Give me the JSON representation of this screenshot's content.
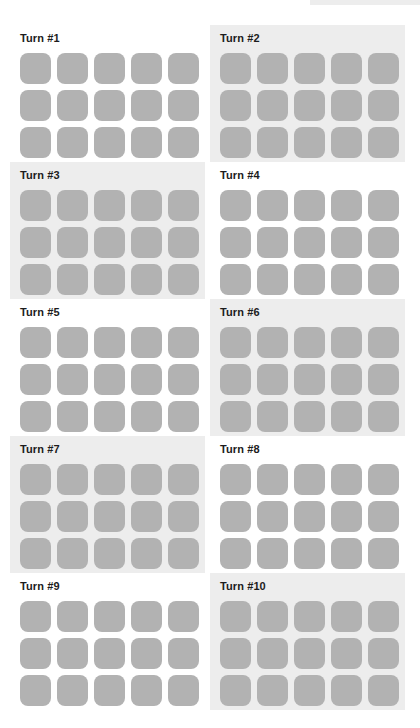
{
  "canvas": {
    "width": 420,
    "height": 728,
    "background_color": "#ffffff"
  },
  "palette": {
    "tile_color": "#b2b2b2",
    "panel_shaded_background": "#ededed",
    "panel_plain_background": "#ffffff",
    "label_color": "#1c1c1c"
  },
  "board": {
    "columns": 2,
    "rows": 5,
    "grid_columns_per_panel": 5,
    "grid_rows_per_panel": 3,
    "tiles_per_panel": 15,
    "panels": [
      {
        "label": "Turn #1",
        "turn_number": 1,
        "shaded": false,
        "tiles": [
          [
            "#b2b2b2",
            "#b2b2b2",
            "#b2b2b2",
            "#b2b2b2",
            "#b2b2b2"
          ],
          [
            "#b2b2b2",
            "#b2b2b2",
            "#b2b2b2",
            "#b2b2b2",
            "#b2b2b2"
          ],
          [
            "#b2b2b2",
            "#b2b2b2",
            "#b2b2b2",
            "#b2b2b2",
            "#b2b2b2"
          ]
        ]
      },
      {
        "label": "Turn #2",
        "turn_number": 2,
        "shaded": true,
        "tiles": [
          [
            "#b2b2b2",
            "#b2b2b2",
            "#b2b2b2",
            "#b2b2b2",
            "#b2b2b2"
          ],
          [
            "#b2b2b2",
            "#b2b2b2",
            "#b2b2b2",
            "#b2b2b2",
            "#b2b2b2"
          ],
          [
            "#b2b2b2",
            "#b2b2b2",
            "#b2b2b2",
            "#b2b2b2",
            "#b2b2b2"
          ]
        ]
      },
      {
        "label": "Turn #3",
        "turn_number": 3,
        "shaded": true,
        "tiles": [
          [
            "#b2b2b2",
            "#b2b2b2",
            "#b2b2b2",
            "#b2b2b2",
            "#b2b2b2"
          ],
          [
            "#b2b2b2",
            "#b2b2b2",
            "#b2b2b2",
            "#b2b2b2",
            "#b2b2b2"
          ],
          [
            "#b2b2b2",
            "#b2b2b2",
            "#b2b2b2",
            "#b2b2b2",
            "#b2b2b2"
          ]
        ]
      },
      {
        "label": "Turn #4",
        "turn_number": 4,
        "shaded": false,
        "tiles": [
          [
            "#b2b2b2",
            "#b2b2b2",
            "#b2b2b2",
            "#b2b2b2",
            "#b2b2b2"
          ],
          [
            "#b2b2b2",
            "#b2b2b2",
            "#b2b2b2",
            "#b2b2b2",
            "#b2b2b2"
          ],
          [
            "#b2b2b2",
            "#b2b2b2",
            "#b2b2b2",
            "#b2b2b2",
            "#b2b2b2"
          ]
        ]
      },
      {
        "label": "Turn #5",
        "turn_number": 5,
        "shaded": false,
        "tiles": [
          [
            "#b2b2b2",
            "#b2b2b2",
            "#b2b2b2",
            "#b2b2b2",
            "#b2b2b2"
          ],
          [
            "#b2b2b2",
            "#b2b2b2",
            "#b2b2b2",
            "#b2b2b2",
            "#b2b2b2"
          ],
          [
            "#b2b2b2",
            "#b2b2b2",
            "#b2b2b2",
            "#b2b2b2",
            "#b2b2b2"
          ]
        ]
      },
      {
        "label": "Turn #6",
        "turn_number": 6,
        "shaded": true,
        "tiles": [
          [
            "#b2b2b2",
            "#b2b2b2",
            "#b2b2b2",
            "#b2b2b2",
            "#b2b2b2"
          ],
          [
            "#b2b2b2",
            "#b2b2b2",
            "#b2b2b2",
            "#b2b2b2",
            "#b2b2b2"
          ],
          [
            "#b2b2b2",
            "#b2b2b2",
            "#b2b2b2",
            "#b2b2b2",
            "#b2b2b2"
          ]
        ]
      },
      {
        "label": "Turn #7",
        "turn_number": 7,
        "shaded": true,
        "tiles": [
          [
            "#b2b2b2",
            "#b2b2b2",
            "#b2b2b2",
            "#b2b2b2",
            "#b2b2b2"
          ],
          [
            "#b2b2b2",
            "#b2b2b2",
            "#b2b2b2",
            "#b2b2b2",
            "#b2b2b2"
          ],
          [
            "#b2b2b2",
            "#b2b2b2",
            "#b2b2b2",
            "#b2b2b2",
            "#b2b2b2"
          ]
        ]
      },
      {
        "label": "Turn #8",
        "turn_number": 8,
        "shaded": false,
        "tiles": [
          [
            "#b2b2b2",
            "#b2b2b2",
            "#b2b2b2",
            "#b2b2b2",
            "#b2b2b2"
          ],
          [
            "#b2b2b2",
            "#b2b2b2",
            "#b2b2b2",
            "#b2b2b2",
            "#b2b2b2"
          ],
          [
            "#b2b2b2",
            "#b2b2b2",
            "#b2b2b2",
            "#b2b2b2",
            "#b2b2b2"
          ]
        ]
      },
      {
        "label": "Turn #9",
        "turn_number": 9,
        "shaded": false,
        "tiles": [
          [
            "#b2b2b2",
            "#b2b2b2",
            "#b2b2b2",
            "#b2b2b2",
            "#b2b2b2"
          ],
          [
            "#b2b2b2",
            "#b2b2b2",
            "#b2b2b2",
            "#b2b2b2",
            "#b2b2b2"
          ],
          [
            "#b2b2b2",
            "#b2b2b2",
            "#b2b2b2",
            "#b2b2b2",
            "#b2b2b2"
          ]
        ]
      },
      {
        "label": "Turn #10",
        "turn_number": 10,
        "shaded": true,
        "tiles": [
          [
            "#b2b2b2",
            "#b2b2b2",
            "#b2b2b2",
            "#b2b2b2",
            "#b2b2b2"
          ],
          [
            "#b2b2b2",
            "#b2b2b2",
            "#b2b2b2",
            "#b2b2b2",
            "#b2b2b2"
          ],
          [
            "#b2b2b2",
            "#b2b2b2",
            "#b2b2b2",
            "#b2b2b2",
            "#b2b2b2"
          ]
        ]
      }
    ]
  }
}
